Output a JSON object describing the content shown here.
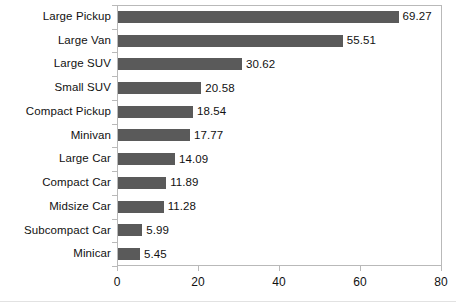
{
  "chart_data": {
    "type": "bar",
    "orientation": "horizontal",
    "title": "",
    "subtitle": "",
    "xlabel": "",
    "ylabel": "",
    "xlim": [
      0,
      80
    ],
    "xticks": [
      "0",
      "20",
      "40",
      "60",
      "80"
    ],
    "xtick_values": [
      0,
      20,
      40,
      60,
      80
    ],
    "grid": false,
    "legend": false,
    "legend_position": "none",
    "bar_color": "#5a5a5a",
    "frame_color": "#b9b9b9",
    "text_color": "#111111",
    "show_value_labels": true,
    "categories": [
      "Large Pickup",
      "Large Van",
      "Large SUV",
      "Small SUV",
      "Compact Pickup",
      "Minivan",
      "Large Car",
      "Compact Car",
      "Midsize Car",
      "Subcompact Car",
      "Minicar"
    ],
    "values": [
      69.27,
      55.51,
      30.62,
      20.58,
      18.54,
      17.77,
      14.09,
      11.89,
      11.28,
      5.99,
      5.45
    ],
    "value_labels": [
      "69.27",
      "55.51",
      "30.62",
      "20.58",
      "18.54",
      "17.77",
      "14.09",
      "11.89",
      "11.28",
      "5.99",
      "5.45"
    ]
  }
}
